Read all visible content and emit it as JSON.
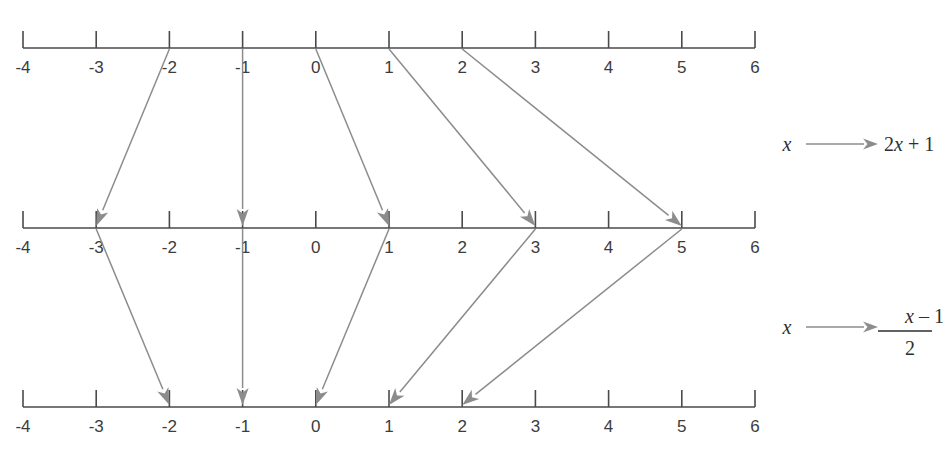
{
  "diagram": {
    "title": "",
    "type": "number-line-mapping",
    "colors": {
      "axis": "#4a4a4a",
      "arrow": "#8c8c8c",
      "label": "#3c3c3c",
      "expression": "#2e2e2e",
      "background": "#ffffff"
    },
    "number_lines": [
      {
        "id": "top",
        "name": "domain-line",
        "min": -4,
        "max": 6,
        "ticks": [
          "-4",
          "-3",
          "-2",
          "-1",
          "0",
          "1",
          "2",
          "3",
          "4",
          "5",
          "6"
        ],
        "tick_values": [
          -4,
          -3,
          -2,
          -1,
          0,
          1,
          2,
          3,
          4,
          5,
          6
        ],
        "label_position": "below"
      },
      {
        "id": "middle",
        "name": "image-line",
        "min": -4,
        "max": 6,
        "ticks": [
          "-4",
          "-3",
          "-2",
          "-1",
          "0",
          "1",
          "2",
          "3",
          "4",
          "5",
          "6"
        ],
        "tick_values": [
          -4,
          -3,
          -2,
          -1,
          0,
          1,
          2,
          3,
          4,
          5,
          6
        ],
        "label_position": "below"
      },
      {
        "id": "bottom",
        "name": "inverse-image-line",
        "min": -4,
        "max": 6,
        "ticks": [
          "-4",
          "-3",
          "-2",
          "-1",
          "0",
          "1",
          "2",
          "3",
          "4",
          "5",
          "6"
        ],
        "tick_values": [
          -4,
          -3,
          -2,
          -1,
          0,
          1,
          2,
          3,
          4,
          5,
          6
        ],
        "label_position": "below"
      }
    ],
    "mappings": [
      {
        "id": "map-top-to-middle",
        "name": "function-2x-plus-1",
        "from_line": "top",
        "to_line": "middle",
        "rule_label": {
          "input": "x",
          "output_text": "2x + 1",
          "output_parts": {
            "coefficient": "2",
            "variable": "x",
            "operator": "+",
            "constant": "1"
          },
          "fraction": false
        },
        "pairs": [
          {
            "from": -2,
            "to": -3
          },
          {
            "from": -1,
            "to": -1
          },
          {
            "from": 0,
            "to": 1
          },
          {
            "from": 1,
            "to": 3
          },
          {
            "from": 2,
            "to": 5
          }
        ]
      },
      {
        "id": "map-middle-to-bottom",
        "name": "function-x-minus-1-over-2",
        "from_line": "middle",
        "to_line": "bottom",
        "rule_label": {
          "input": "x",
          "output_text": "(x - 1) / 2",
          "output_parts": {
            "numerator_variable": "x",
            "numerator_operator": "–",
            "numerator_constant": "1",
            "denominator": "2"
          },
          "fraction": true
        },
        "pairs": [
          {
            "from": -3,
            "to": -2
          },
          {
            "from": -1,
            "to": -1
          },
          {
            "from": 1,
            "to": 0
          },
          {
            "from": 3,
            "to": 1
          },
          {
            "from": 5,
            "to": 2
          }
        ]
      }
    ]
  }
}
